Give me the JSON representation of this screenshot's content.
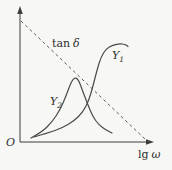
{
  "figure": {
    "background": "#f7f7f5",
    "ink_color": "#3d3d3d",
    "origin_label": "O",
    "x_axis_label_prefix": "lg",
    "x_axis_label_symbol": "ω"
  },
  "labels": {
    "tan_delta": {
      "prefix": "tan",
      "symbol": "δ"
    },
    "y1": {
      "base": "Y",
      "sub": "1"
    },
    "y2": {
      "base": "Y",
      "sub": "2"
    }
  },
  "chart_data": {
    "type": "line",
    "title": "",
    "xlabel": "lg ω",
    "ylabel": "",
    "origin_label": "O",
    "axis_style": "schematic axes with arrowheads, no ticks, no gridlines",
    "legend_position": "inline annotations",
    "series": [
      {
        "name": "tan δ",
        "line_style": "dashed",
        "shape": "straight line descending from top of y-axis to x-axis at far right",
        "points_px": [
          [
            21,
            21
          ],
          [
            146,
            140
          ]
        ]
      },
      {
        "name": "Y1",
        "line_style": "solid",
        "shape": "sigmoid: low flat tail, steep rise near centre-right, high plateau with slight droop at tip",
        "points_px": [
          [
            34,
            137
          ],
          [
            48,
            133
          ],
          [
            62,
            128
          ],
          [
            74,
            121
          ],
          [
            83,
            112
          ],
          [
            89,
            100
          ],
          [
            93,
            86
          ],
          [
            97,
            70
          ],
          [
            101,
            57
          ],
          [
            106,
            49
          ],
          [
            112,
            45.5
          ],
          [
            119,
            43.8
          ],
          [
            125,
            44.2
          ],
          [
            128,
            46.5
          ]
        ]
      },
      {
        "name": "Y2",
        "line_style": "solid",
        "shape": "asymmetric resonance peak centred near middle of x range, decaying tail to the right",
        "points_px": [
          [
            31,
            138
          ],
          [
            42,
            132
          ],
          [
            52,
            122
          ],
          [
            60,
            110
          ],
          [
            66,
            96
          ],
          [
            70,
            85
          ],
          [
            73,
            79
          ],
          [
            76,
            77.5
          ],
          [
            79,
            81
          ],
          [
            83,
            92
          ],
          [
            88,
            105
          ],
          [
            93,
            117
          ],
          [
            99,
            125
          ],
          [
            106,
            130
          ],
          [
            112,
            133
          ]
        ]
      }
    ]
  }
}
